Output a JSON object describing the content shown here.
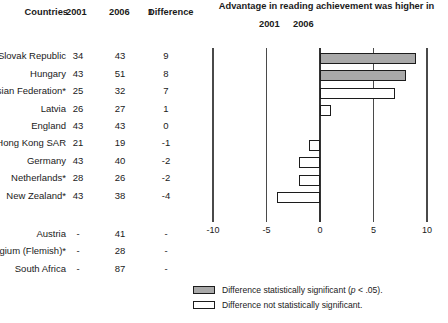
{
  "table": {
    "headers": {
      "countries": "Countries",
      "year1": "2001",
      "year2": "2006",
      "difference": "Difference",
      "difference_superscript": "1"
    },
    "rows": [
      {
        "country": "Slovak Republic",
        "y2001": "34",
        "y2006": "43",
        "difference": "9",
        "value": 9,
        "significant": true
      },
      {
        "country": "Hungary",
        "y2001": "43",
        "y2006": "51",
        "difference": "8",
        "value": 8,
        "significant": true
      },
      {
        "country": "Russian Federation*",
        "y2001": "25",
        "y2006": "32",
        "difference": "7",
        "value": 7,
        "significant": false
      },
      {
        "country": "Latvia",
        "y2001": "26",
        "y2006": "27",
        "difference": "1",
        "value": 1,
        "significant": false
      },
      {
        "country": "England",
        "y2001": "43",
        "y2006": "43",
        "difference": "0",
        "value": 0,
        "significant": false
      },
      {
        "country": "Hong Kong SAR",
        "y2001": "21",
        "y2006": "19",
        "difference": "-1",
        "value": -1,
        "significant": false
      },
      {
        "country": "Germany",
        "y2001": "43",
        "y2006": "40",
        "difference": "-2",
        "value": -2,
        "significant": false
      },
      {
        "country": "Netherlands*",
        "y2001": "28",
        "y2006": "26",
        "difference": "-2",
        "value": -2,
        "significant": false
      },
      {
        "country": "New Zealand*",
        "y2001": "43",
        "y2006": "38",
        "difference": "-4",
        "value": -4,
        "significant": false
      }
    ],
    "rows_nodata": [
      {
        "country": "Austria",
        "y2001": "-",
        "y2006": "41",
        "difference": "-"
      },
      {
        "country": "Belgium (Flemish)*",
        "y2001": "-",
        "y2006": "28",
        "difference": "-"
      },
      {
        "country": "South Africa",
        "y2001": "-",
        "y2006": "87",
        "difference": "-"
      }
    ]
  },
  "chart_data": {
    "type": "bar",
    "orientation": "horizontal",
    "title": "Advantage in reading achievement was higher in",
    "subtitle_left": "2001",
    "subtitle_right": "2006",
    "categories": [
      "Slovak Republic",
      "Hungary",
      "Russian Federation*",
      "Latvia",
      "England",
      "Hong Kong SAR",
      "Germany",
      "Netherlands*",
      "New Zealand*"
    ],
    "values": [
      9,
      8,
      7,
      1,
      0,
      -1,
      -2,
      -2,
      -4
    ],
    "series": [
      {
        "name": "Difference in reading achievement (2006 minus 2001)",
        "values": [
          9,
          8,
          7,
          1,
          0,
          -1,
          -2,
          -2,
          -4
        ]
      }
    ],
    "significant": [
      true,
      true,
      false,
      false,
      false,
      false,
      false,
      false,
      false
    ],
    "xlabel": "",
    "ylabel": "",
    "xlim": [
      -10,
      10
    ],
    "xticks": [
      -10,
      -5,
      0,
      5,
      10
    ],
    "xtick_labels": [
      "-10",
      "-5",
      "0",
      "5",
      "10"
    ],
    "grid": true,
    "legend_position": "bottom-right",
    "colors": {
      "significant_fill": "#a9a9a9",
      "not_significant_fill": "#ffffff",
      "bar_border": "#1c1c1c",
      "gridline": "#4a4a4a"
    }
  },
  "legend": {
    "items": [
      {
        "swatch": "significant",
        "prefix": "Difference statistically significant (",
        "italic": "p",
        "suffix": " < .05)."
      },
      {
        "swatch": "not_significant",
        "prefix": "Difference not statistically significant.",
        "italic": "",
        "suffix": ""
      }
    ]
  }
}
